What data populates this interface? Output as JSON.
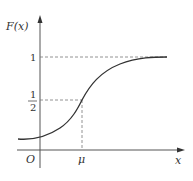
{
  "diagram": {
    "y_axis_label": "F(x)",
    "x_axis_label": "x",
    "origin_label": "O",
    "mu_label": "μ",
    "one_label": "1",
    "half_numerator": "1",
    "half_denominator": "2"
  },
  "colors": {
    "curve": "#333333",
    "axes": "#555555",
    "dashed": "#777777"
  }
}
